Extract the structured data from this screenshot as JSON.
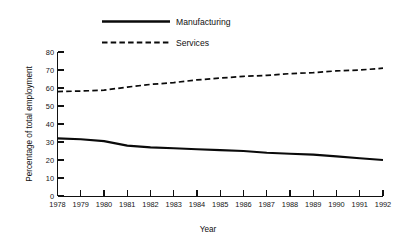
{
  "chart_data": {
    "type": "line",
    "title": "",
    "xlabel": "Year",
    "ylabel": "Percentage of total employment",
    "categories": [
      "1978",
      "1979",
      "1980",
      "1981",
      "1982",
      "1983",
      "1984",
      "1985",
      "1986",
      "1987",
      "1988",
      "1989",
      "1990",
      "1991",
      "1992"
    ],
    "x": [
      1978,
      1979,
      1980,
      1981,
      1982,
      1983,
      1984,
      1985,
      1986,
      1987,
      1988,
      1989,
      1990,
      1991,
      1992
    ],
    "xlim": [
      1978,
      1992
    ],
    "ylim": [
      0,
      80
    ],
    "yticks": [
      0,
      10,
      20,
      30,
      40,
      50,
      60,
      70,
      80
    ],
    "ytick_labels": [
      "0",
      "10",
      "20",
      "30",
      "40",
      "50",
      "60",
      "70",
      "80"
    ],
    "grid": false,
    "legend_position": "top-center",
    "series": [
      {
        "name": "Manufacturing",
        "style": "solid",
        "color": "#0a0a0a",
        "values": [
          32,
          31.5,
          30.5,
          28,
          27,
          26.5,
          26,
          25.5,
          25,
          24,
          23.5,
          23,
          22,
          21,
          20
        ]
      },
      {
        "name": "Services",
        "style": "dashed",
        "color": "#0a0a0a",
        "values": [
          58,
          58.3,
          58.8,
          60.5,
          62,
          63,
          64.5,
          65.5,
          66.5,
          67,
          68,
          68.5,
          69.5,
          70,
          71
        ]
      }
    ]
  },
  "legend": {
    "entries": [
      {
        "label": "Manufacturing",
        "style": "solid"
      },
      {
        "label": "Services",
        "style": "dashed"
      }
    ]
  },
  "axes": {
    "y_axis_title": "Percentage of total employment",
    "x_axis_title": "Year"
  }
}
